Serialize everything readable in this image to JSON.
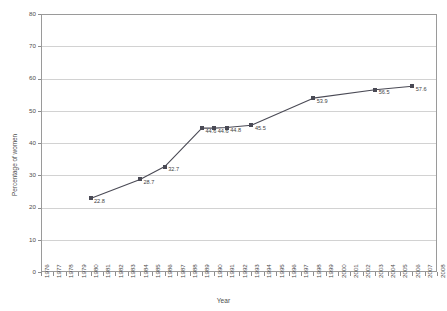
{
  "chart_data": {
    "type": "line",
    "title": "",
    "xlabel": "Year",
    "ylabel": "Percentage of women",
    "xlim": [
      1976,
      2008
    ],
    "ylim": [
      0,
      80
    ],
    "ytick_step": 10,
    "grid": "horizontal",
    "legend": "none",
    "line_color": "#4a4a55",
    "marker": "square",
    "marker_color": "#4a4a55",
    "gridline_color": "#d2d2d2",
    "axis_color": "#9a9a9a",
    "yticks": [
      "0",
      "10",
      "20",
      "30",
      "40",
      "50",
      "60",
      "70",
      "80"
    ],
    "xticks": [
      "1976",
      "1977",
      "1978",
      "1979",
      "1980",
      "1981",
      "1982",
      "1983",
      "1984",
      "1985",
      "1986",
      "1987",
      "1988",
      "1989",
      "1990",
      "1991",
      "1992",
      "1993",
      "1994",
      "1995",
      "1996",
      "1997",
      "1998",
      "1999",
      "2000",
      "2001",
      "2002",
      "2003",
      "2004",
      "2005",
      "2006",
      "2007",
      "2008"
    ],
    "x": [
      1980,
      1984,
      1986,
      1989,
      1990,
      1991,
      1993,
      1998,
      2003,
      2006
    ],
    "values": [
      22.8,
      28.7,
      32.7,
      44.6,
      44.6,
      44.8,
      45.5,
      53.9,
      56.5,
      57.6
    ],
    "point_labels": [
      "22.8",
      "28.7",
      "32.7",
      "44.6",
      "44.6",
      "44.8",
      "45.5",
      "53.9",
      "56.5",
      "57.6"
    ],
    "series": [
      {
        "name": "Percentage of women",
        "points": [
          {
            "x": 1980,
            "y": 22.8,
            "label": "22.8"
          },
          {
            "x": 1984,
            "y": 28.7,
            "label": "28.7"
          },
          {
            "x": 1986,
            "y": 32.7,
            "label": "32.7"
          },
          {
            "x": 1989,
            "y": 44.6,
            "label": "44.6"
          },
          {
            "x": 1990,
            "y": 44.6,
            "label": "44.6"
          },
          {
            "x": 1991,
            "y": 44.8,
            "label": "44.8"
          },
          {
            "x": 1993,
            "y": 45.5,
            "label": "45.5"
          },
          {
            "x": 1998,
            "y": 53.9,
            "label": "53.9"
          },
          {
            "x": 2003,
            "y": 56.5,
            "label": "56.5"
          },
          {
            "x": 2006,
            "y": 57.6,
            "label": "57.6"
          }
        ]
      }
    ]
  }
}
